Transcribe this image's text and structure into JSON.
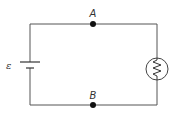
{
  "diagram": {
    "type": "circuit",
    "labels": {
      "emf": "ε",
      "point_a": "A",
      "point_b": "B"
    },
    "components": [
      {
        "id": "battery",
        "kind": "battery",
        "label": "ε",
        "position": "left"
      },
      {
        "id": "lamp",
        "kind": "lamp",
        "position": "right"
      },
      {
        "id": "node_a",
        "kind": "junction",
        "label": "A",
        "position": "top-middle"
      },
      {
        "id": "node_b",
        "kind": "junction",
        "label": "B",
        "position": "bottom-middle"
      }
    ],
    "colors": {
      "wire": "#555555",
      "node": "#111111",
      "text": "#333333",
      "background": "#ffffff"
    }
  }
}
